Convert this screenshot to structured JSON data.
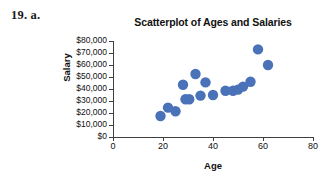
{
  "exercise": {
    "label": "19. a."
  },
  "chart_data": {
    "type": "scatter",
    "title": "Scatterplot of Ages and Salaries",
    "xlabel": "Age",
    "ylabel": "Salary",
    "xlim": [
      0,
      80
    ],
    "ylim": [
      0,
      80000
    ],
    "xticks": [
      0,
      20,
      40,
      60,
      80
    ],
    "xtick_labels": [
      "0",
      "20",
      "40",
      "60",
      "80"
    ],
    "yticks": [
      0,
      10000,
      20000,
      30000,
      40000,
      50000,
      60000,
      70000,
      80000
    ],
    "ytick_labels": [
      "$0",
      "$10,000",
      "$20,000",
      "$30,000",
      "$40,000",
      "$50,000",
      "$60,000",
      "$70,000",
      "$80,000"
    ],
    "grid": false,
    "legend": null,
    "marker_color": "#4a72b8",
    "marker_size": 5.2,
    "points": [
      {
        "x": 19,
        "y": 17500
      },
      {
        "x": 22,
        "y": 24500
      },
      {
        "x": 25,
        "y": 21500
      },
      {
        "x": 28,
        "y": 43500
      },
      {
        "x": 29,
        "y": 31500
      },
      {
        "x": 30.5,
        "y": 31500
      },
      {
        "x": 33,
        "y": 52500
      },
      {
        "x": 35,
        "y": 34500
      },
      {
        "x": 37,
        "y": 45500
      },
      {
        "x": 40,
        "y": 35000
      },
      {
        "x": 45,
        "y": 38500
      },
      {
        "x": 48,
        "y": 38500
      },
      {
        "x": 50,
        "y": 39500
      },
      {
        "x": 52,
        "y": 42000
      },
      {
        "x": 55,
        "y": 46000
      },
      {
        "x": 58,
        "y": 73000
      },
      {
        "x": 62,
        "y": 60000
      }
    ]
  }
}
